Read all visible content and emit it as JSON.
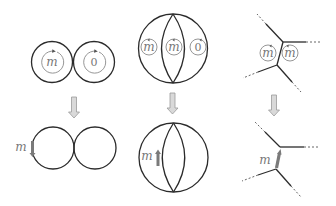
{
  "diagram": {
    "colors": {
      "stroke": "#2b2b2b",
      "label": "#777777",
      "small_loop": "#8a8a8a",
      "flow_arrow_fill": "#d9d9d9",
      "flow_arrow_stroke": "#9a9a9a",
      "thick_edge": "#7a7a7a"
    },
    "panels": [
      {
        "id": "two-circles",
        "top": {
          "loops": [
            {
              "label": "m"
            },
            {
              "label": "0"
            }
          ]
        },
        "bottom": {
          "edge_label": "m",
          "edge_arrow": "down"
        }
      },
      {
        "id": "sphere-lens",
        "top": {
          "loops": [
            {
              "label": "m"
            },
            {
              "label": "m"
            },
            {
              "label": "0"
            }
          ]
        },
        "bottom": {
          "edge_label": "m",
          "edge_arrow": "up"
        }
      },
      {
        "id": "vertex-pair",
        "top": {
          "loops": [
            {
              "label": "m"
            },
            {
              "label": "m"
            }
          ]
        },
        "bottom": {
          "edge_label": "m",
          "edge_arrow": "up"
        }
      }
    ]
  }
}
